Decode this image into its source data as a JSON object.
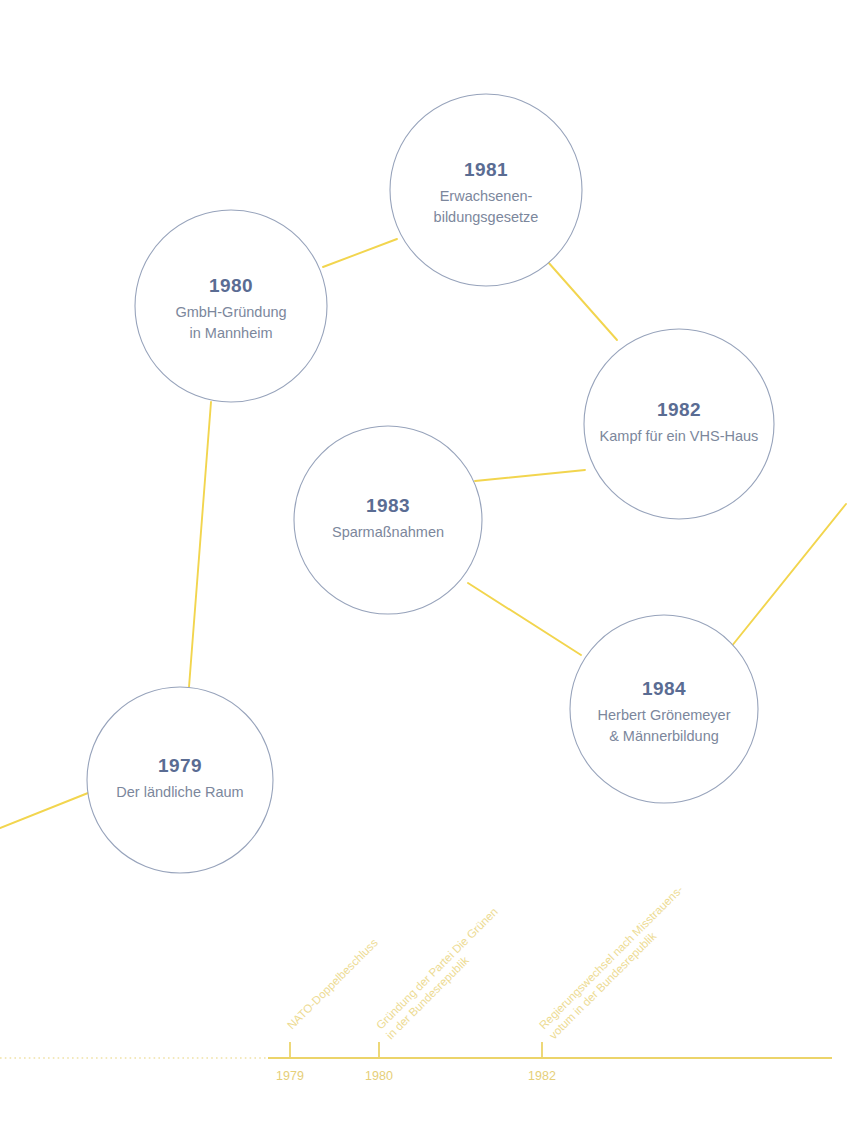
{
  "chart_data": {
    "type": "timeline",
    "title": "",
    "subtitle": "",
    "xlabel": "",
    "ylabel": "",
    "grid": false,
    "legend_position": "none",
    "axis": {
      "orientation": "horizontal",
      "tick_labels": [
        "1979",
        "1980",
        "1982"
      ],
      "tick_x": [
        290,
        379,
        542
      ],
      "range_label_start": "1979",
      "range_label_end": "1982",
      "line_style_left": "dotted",
      "line_style_right": "solid",
      "color": "#ecd46a"
    },
    "nodes": [
      {
        "year": "1979",
        "desc_lines": [
          "Der ländliche Raum"
        ],
        "cx": 180,
        "cy": 780,
        "r": 93
      },
      {
        "year": "1980",
        "desc_lines": [
          "GmbH-Gründung",
          "in Mannheim"
        ],
        "cx": 231,
        "cy": 306,
        "r": 96
      },
      {
        "year": "1981",
        "desc_lines": [
          "Erwachsenen-",
          "bildungsgesetze"
        ],
        "cx": 486,
        "cy": 190,
        "r": 96
      },
      {
        "year": "1982",
        "desc_lines": [
          "Kampf für ein VHS-Haus"
        ],
        "cx": 679,
        "cy": 424,
        "r": 95
      },
      {
        "year": "1983",
        "desc_lines": [
          "Sparmaßnahmen"
        ],
        "cx": 388,
        "cy": 520,
        "r": 94
      },
      {
        "year": "1984",
        "desc_lines": [
          "Herbert Grönemeyer",
          "& Männerbildung"
        ],
        "cx": 664,
        "cy": 709,
        "r": 94
      }
    ],
    "connectors": [
      {
        "from": "edge-left",
        "to": "1979",
        "x1": 0,
        "y1": 828,
        "x2": 88,
        "y2": 793
      },
      {
        "from": "1979",
        "to": "1980",
        "x1": 189,
        "y1": 687,
        "x2": 211,
        "y2": 402
      },
      {
        "from": "1980",
        "to": "1981",
        "x1": 323,
        "y1": 267,
        "x2": 397,
        "y2": 239
      },
      {
        "from": "1981",
        "to": "1982",
        "x1": 548,
        "y1": 262,
        "x2": 617,
        "y2": 340
      },
      {
        "from": "1982",
        "to": "1983",
        "x1": 585,
        "y1": 470,
        "x2": 475,
        "y2": 481
      },
      {
        "from": "1983",
        "to": "1984",
        "x1": 468,
        "y1": 583,
        "x2": 581,
        "y2": 655
      },
      {
        "from": "1984",
        "to": "edge-right",
        "x1": 731,
        "y1": 647,
        "x2": 846,
        "y2": 504
      }
    ],
    "events": [
      {
        "lines": [
          "NATO-Doppelbeschluss"
        ],
        "tick_x": 290,
        "anchor_x": 292,
        "anchor_y": 1030,
        "rotation": -45
      },
      {
        "lines": [
          "Gründung der Partei Die Grünen",
          "in der Bundesrepublik"
        ],
        "tick_x": 379,
        "anchor_x": 381,
        "anchor_y": 1030,
        "rotation": -45
      },
      {
        "lines": [
          "Regierungswechsel nach Misstrauens-",
          "votum in der Bundesrepublik"
        ],
        "tick_x": 542,
        "anchor_x": 544,
        "anchor_y": 1030,
        "rotation": -45
      }
    ]
  },
  "colors": {
    "circle_stroke": "#97a3bb",
    "year_text": "#5a6c93",
    "desc_text": "#7c879c",
    "connector": "#f2d54e",
    "axis": "#ecd46a",
    "event_text": "#eddb93",
    "background": "#ffffff"
  }
}
